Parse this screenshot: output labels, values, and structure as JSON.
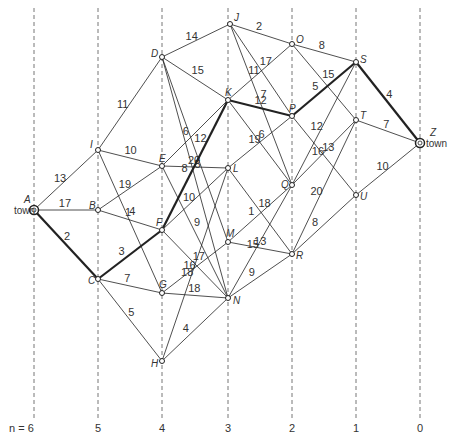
{
  "diagram": {
    "stages": [
      {
        "x": 34,
        "label": "n = 6"
      },
      {
        "x": 98,
        "label": "5"
      },
      {
        "x": 162,
        "label": "4"
      },
      {
        "x": 228,
        "label": "3"
      },
      {
        "x": 292,
        "label": "2"
      },
      {
        "x": 356,
        "label": "1"
      },
      {
        "x": 420,
        "label": "0"
      }
    ],
    "nodes": [
      {
        "id": "A",
        "x": 34,
        "y": 210,
        "lx": -26,
        "ly": -4,
        "town": true
      },
      {
        "id": "I",
        "x": 98,
        "y": 150,
        "lx": -8,
        "ly": -2
      },
      {
        "id": "B",
        "x": 98,
        "y": 210,
        "lx": -9,
        "ly": -1
      },
      {
        "id": "C",
        "x": 98,
        "y": 279,
        "lx": -10,
        "ly": 5
      },
      {
        "id": "D",
        "x": 162,
        "y": 57,
        "lx": -11,
        "ly": 0
      },
      {
        "id": "E",
        "x": 162,
        "y": 166,
        "lx": -3,
        "ly": -4
      },
      {
        "id": "F",
        "x": 162,
        "y": 230,
        "lx": -6,
        "ly": -4
      },
      {
        "id": "G",
        "x": 162,
        "y": 293,
        "lx": -3,
        "ly": -5
      },
      {
        "id": "H",
        "x": 162,
        "y": 361,
        "lx": -11,
        "ly": 6
      },
      {
        "id": "J",
        "x": 230,
        "y": 24,
        "lx": 4,
        "ly": -3
      },
      {
        "id": "K",
        "x": 228,
        "y": 100,
        "lx": -3,
        "ly": -4
      },
      {
        "id": "L",
        "x": 228,
        "y": 168,
        "lx": 5,
        "ly": 4
      },
      {
        "id": "M",
        "x": 228,
        "y": 242,
        "lx": -2,
        "ly": -5
      },
      {
        "id": "N",
        "x": 228,
        "y": 298,
        "lx": 5,
        "ly": 6
      },
      {
        "id": "O",
        "x": 292,
        "y": 44,
        "lx": 4,
        "ly": -1
      },
      {
        "id": "P",
        "x": 292,
        "y": 116,
        "lx": -3,
        "ly": -4
      },
      {
        "id": "Q",
        "x": 292,
        "y": 185,
        "lx": -11,
        "ly": 3
      },
      {
        "id": "R",
        "x": 292,
        "y": 254,
        "lx": 4,
        "ly": 5
      },
      {
        "id": "S",
        "x": 356,
        "y": 62,
        "lx": 4,
        "ly": 1
      },
      {
        "id": "T",
        "x": 356,
        "y": 120,
        "lx": 4,
        "ly": -1
      },
      {
        "id": "U",
        "x": 356,
        "y": 195,
        "lx": 4,
        "ly": 5
      },
      {
        "id": "Z",
        "x": 420,
        "y": 143,
        "lx": 5,
        "ly": -6,
        "town": true
      }
    ],
    "edges": [
      {
        "a": "A",
        "b": "I",
        "w": "13",
        "bold": false
      },
      {
        "a": "A",
        "b": "B",
        "w": "17",
        "bold": false
      },
      {
        "a": "A",
        "b": "C",
        "w": "2",
        "bold": true
      },
      {
        "a": "I",
        "b": "D",
        "w": "11",
        "bold": false
      },
      {
        "a": "I",
        "b": "E",
        "w": "10",
        "bold": false
      },
      {
        "a": "I",
        "b": "G",
        "w": "4",
        "bold": false
      },
      {
        "a": "B",
        "b": "E",
        "w": "19",
        "bold": false
      },
      {
        "a": "B",
        "b": "F",
        "w": "1",
        "bold": false
      },
      {
        "a": "C",
        "b": "F",
        "w": "3",
        "bold": true
      },
      {
        "a": "C",
        "b": "G",
        "w": "7",
        "bold": false
      },
      {
        "a": "C",
        "b": "H",
        "w": "5",
        "bold": false
      },
      {
        "a": "D",
        "b": "J",
        "w": "14",
        "bold": false
      },
      {
        "a": "D",
        "b": "K",
        "w": "15",
        "bold": false
      },
      {
        "a": "D",
        "b": "M",
        "w": "12",
        "bold": false
      },
      {
        "a": "D",
        "b": "N",
        "w": "5",
        "bold": false
      },
      {
        "a": "E",
        "b": "K",
        "w": "6",
        "bold": false
      },
      {
        "a": "E",
        "b": "L",
        "w": "20",
        "bold": false
      },
      {
        "a": "E",
        "b": "N",
        "w": "9",
        "bold": false
      },
      {
        "a": "F",
        "b": "K",
        "w": "8",
        "bold": true
      },
      {
        "a": "F",
        "b": "L",
        "w": "10",
        "bold": false
      },
      {
        "a": "F",
        "b": "N",
        "w": "17",
        "bold": false
      },
      {
        "a": "G",
        "b": "M",
        "w": "16",
        "bold": false
      },
      {
        "a": "G",
        "b": "N",
        "w": "18",
        "bold": false
      },
      {
        "a": "H",
        "b": "L",
        "w": "18",
        "bold": false
      },
      {
        "a": "H",
        "b": "N",
        "w": "4",
        "bold": false
      },
      {
        "a": "J",
        "b": "O",
        "w": "2",
        "bold": false
      },
      {
        "a": "J",
        "b": "Q",
        "w": "7",
        "bold": false
      },
      {
        "a": "J",
        "b": "P",
        "w": "17",
        "bold": false
      },
      {
        "a": "K",
        "b": "O",
        "w": "11",
        "bold": false
      },
      {
        "a": "K",
        "b": "P",
        "w": "12",
        "bold": true
      },
      {
        "a": "K",
        "b": "Q",
        "w": "6",
        "bold": false
      },
      {
        "a": "L",
        "b": "P",
        "w": "19",
        "bold": false
      },
      {
        "a": "L",
        "b": "R",
        "w": "18",
        "bold": false
      },
      {
        "a": "M",
        "b": "Q",
        "w": "1",
        "bold": false
      },
      {
        "a": "M",
        "b": "R",
        "w": "13",
        "bold": false
      },
      {
        "a": "N",
        "b": "Q",
        "w": "15",
        "bold": false
      },
      {
        "a": "N",
        "b": "R",
        "w": "9",
        "bold": false
      },
      {
        "a": "O",
        "b": "S",
        "w": "8",
        "bold": false
      },
      {
        "a": "O",
        "b": "T",
        "w": "15",
        "bold": false
      },
      {
        "a": "P",
        "b": "S",
        "w": "5",
        "bold": true
      },
      {
        "a": "P",
        "b": "U",
        "w": "13",
        "bold": false
      },
      {
        "a": "Q",
        "b": "S",
        "w": "12",
        "bold": false
      },
      {
        "a": "Q",
        "b": "T",
        "w": "16",
        "bold": false
      },
      {
        "a": "R",
        "b": "T",
        "w": "20",
        "bold": false
      },
      {
        "a": "R",
        "b": "U",
        "w": "8",
        "bold": false
      },
      {
        "a": "S",
        "b": "Z",
        "w": "4",
        "bold": true
      },
      {
        "a": "T",
        "b": "Z",
        "w": "7",
        "bold": false
      },
      {
        "a": "U",
        "b": "Z",
        "w": "10",
        "bold": false
      }
    ],
    "town_label": "town"
  }
}
